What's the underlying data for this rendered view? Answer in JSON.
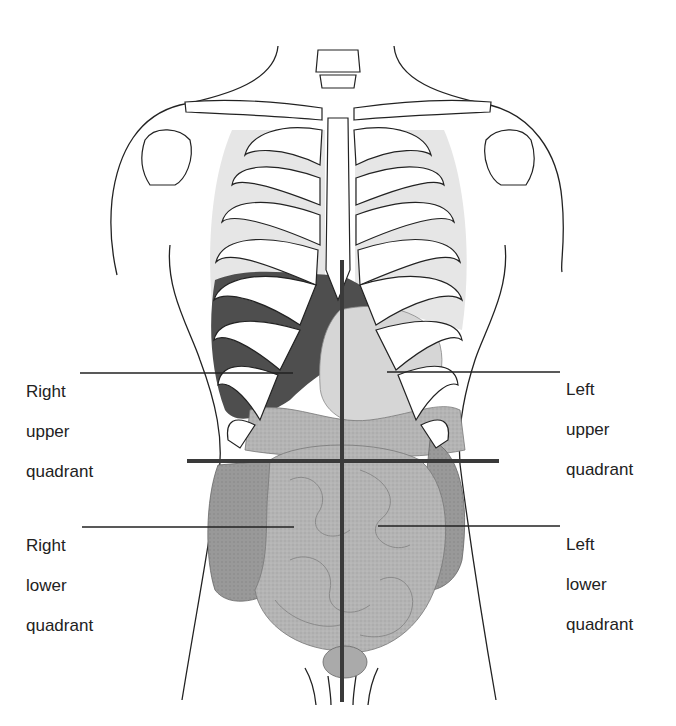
{
  "figure": {
    "labels": {
      "right_upper": {
        "line1": "Right",
        "line2": "upper",
        "line3": "quadrant"
      },
      "left_upper": {
        "line1": "Left",
        "line2": "upper",
        "line3": "quadrant"
      },
      "right_lower": {
        "line1": "Right",
        "line2": "lower",
        "line3": "quadrant"
      },
      "left_lower": {
        "line1": "Left",
        "line2": "lower",
        "line3": "quadrant"
      }
    },
    "colors": {
      "quadrant_lines": "#3a3a3a",
      "outline": "#222222",
      "bone": "#ffffff",
      "liver": "#4a4a4a",
      "stomach": "#d8d8d8",
      "intestine": "#b8b8b8",
      "colon": "#9a9a9a",
      "lung": "#e4e4e4"
    }
  }
}
